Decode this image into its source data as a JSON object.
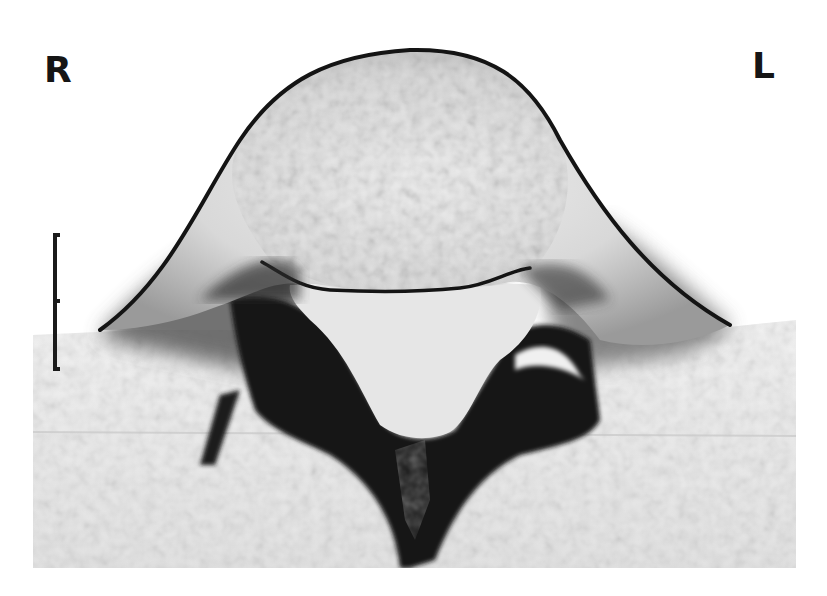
{
  "figure": {
    "orientation_labels": {
      "right": "R",
      "left": "L"
    },
    "scale_bar": {
      "orientation": "vertical",
      "ticks": 3
    },
    "colors": {
      "background": "#ffffff",
      "tissue_light": "#e8e8e8",
      "tissue_dark": "#111111",
      "label": "#151515"
    }
  }
}
